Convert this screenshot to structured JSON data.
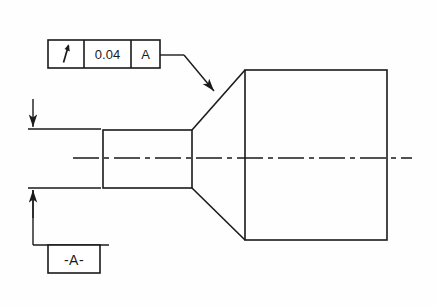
{
  "drawing": {
    "title": "Circular runout tolerance callout on stepped shaft",
    "line_color": "#1a1a1a",
    "background_color": "#fefefe",
    "centerline_color": "#1a1a1a"
  },
  "feature_control_frame": {
    "name": "feature-control-frame",
    "symbol_name": "circular-runout-icon",
    "symbol_meaning": "circular runout",
    "tolerance_value": "0.04",
    "datum_reference": "A",
    "cells": [
      {
        "label": "",
        "kind": "symbol"
      },
      {
        "label": "0.04",
        "kind": "tolerance"
      },
      {
        "label": "A",
        "kind": "datum"
      }
    ],
    "box": {
      "x": 48,
      "y": 40,
      "width": 112,
      "height": 28
    },
    "divider_1_x": 84,
    "divider_2_x": 131
  },
  "datum_feature_symbol": {
    "name": "datum-feature-symbol-a",
    "label": "-A-",
    "box": {
      "x": 48,
      "y": 245,
      "width": 52,
      "height": 28
    }
  },
  "leader": {
    "name": "leader-line-to-cone",
    "horizontal_from_x": 160,
    "horizontal_to_x": 184,
    "y": 55,
    "arrow_tip_x": 217,
    "arrow_tip_y": 94
  },
  "part_geometry": {
    "small_cylinder": {
      "x": 103,
      "y": 130,
      "width": 89,
      "height": 58
    },
    "large_cylinder": {
      "x": 245,
      "y": 70,
      "width": 142,
      "height": 170
    },
    "cone_top": {
      "x1": 192,
      "y1": 130,
      "x2": 245,
      "y2": 70
    },
    "cone_bottom": {
      "x1": 192,
      "y1": 188,
      "x2": 245,
      "y2": 240
    },
    "centerline": {
      "x1": 73,
      "x2": 412,
      "y": 158
    }
  },
  "dimension_witness": {
    "upper_extension_line": {
      "x1": 28,
      "x2": 101,
      "y": 129
    },
    "lower_extension_line": {
      "x1": 28,
      "x2": 101,
      "y": 188
    },
    "upper_arrow": {
      "x": 33,
      "from_y": 99,
      "to_y": 128
    },
    "lower_arrow": {
      "x": 33,
      "from_y": 218,
      "to_y": 189
    },
    "datum_leader": {
      "x": 33,
      "from_y": 189,
      "to_y": 245
    },
    "datum_base_line": {
      "x1": 33,
      "x2": 109,
      "y": 245
    }
  }
}
